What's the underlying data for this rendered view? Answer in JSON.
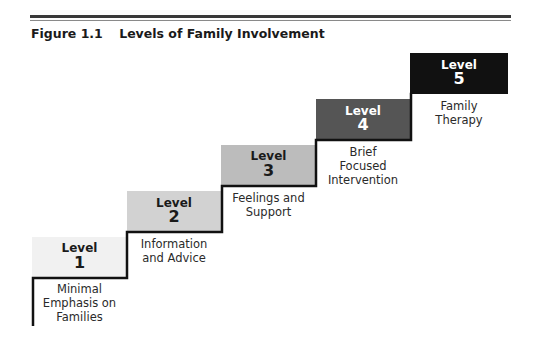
{
  "figure": {
    "number": "Figure 1.1",
    "title": "Levels of Family Involvement"
  },
  "levels": [
    {
      "label": "Level",
      "number": "1",
      "desc": [
        "Minimal",
        "Emphasis on",
        "Families"
      ],
      "fill": "#f1f1f1",
      "text_color": "#1a1a1a"
    },
    {
      "label": "Level",
      "number": "2",
      "desc": [
        "Information",
        "and Advice"
      ],
      "fill": "#d2d2d2",
      "text_color": "#1a1a1a"
    },
    {
      "label": "Level",
      "number": "3",
      "desc": [
        "Feelings and",
        "Support"
      ],
      "fill": "#bcbcbc",
      "text_color": "#1a1a1a"
    },
    {
      "label": "Level",
      "number": "4",
      "desc": [
        "Brief",
        "Focused",
        "Intervention"
      ],
      "fill": "#555555",
      "text_color": "#ffffff"
    },
    {
      "label": "Level",
      "number": "5",
      "desc": [
        "Family",
        "Therapy"
      ],
      "fill": "#111111",
      "text_color": "#ffffff"
    }
  ],
  "colors": {
    "staircase_line": "#111111",
    "rule": "#3a3a3a"
  }
}
